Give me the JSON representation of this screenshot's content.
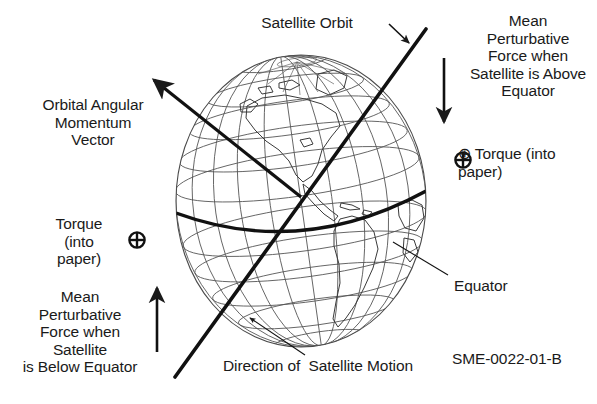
{
  "figure": {
    "code": "SME-0022-01-B",
    "background_color": "#ffffff",
    "ink_color": "#1a1a1a",
    "graticule_color": "#555555"
  },
  "labels": {
    "orbital_angular_momentum": "Orbital Angular\nMomentum\nVector",
    "satellite_orbit": "Satellite Orbit",
    "mean_force_above": "Mean\nPerturbative\nForce when\nSatellite is Above\nEquator",
    "torque_right": "⊕ Torque (into\npaper)",
    "torque_left": "Torque\n(into\npaper)",
    "mean_force_below": "Mean\nPerturbative\nForce when\nSatellite\nis Below Equator",
    "equator": "Equator",
    "direction_motion": "Direction of  Satellite Motion"
  },
  "symbols": {
    "torque_glyph": "circle-plus-cross",
    "torque_right_icon": "torque-into-paper-icon",
    "torque_left_icon": "torque-into-paper-icon"
  },
  "globe": {
    "center_x": 301,
    "center_y": 201,
    "radius_x": 125,
    "radius_y": 146,
    "meridian_count": 12,
    "parallel_count": 11,
    "tilt_degrees": 8,
    "equator_emphasized": true,
    "continents": "North and South America"
  },
  "vectors": {
    "angular_momentum": {
      "name": "orbital-angular-momentum-vector",
      "from_x": 301,
      "from_y": 197,
      "to_x": 148,
      "to_y": 75,
      "arrowhead": "tip"
    },
    "orbit_line": {
      "name": "satellite-orbit-line",
      "from_x": 175,
      "from_y": 377,
      "to_x": 426,
      "to_y": 29,
      "arrowhead": "none"
    },
    "force_above_arrow": {
      "name": "mean-perturbative-force-above-arrow",
      "x": 444,
      "from_y": 58,
      "to_y": 128,
      "direction": "down"
    },
    "force_below_arrow": {
      "name": "mean-perturbative-force-below-arrow",
      "x": 157,
      "from_y": 352,
      "to_y": 282,
      "direction": "up"
    }
  },
  "leaders": {
    "satellite_orbit": {
      "from_x": 389,
      "from_y": 24,
      "to_x": 412,
      "to_y": 46
    },
    "equator": {
      "from_x": 448,
      "from_y": 275,
      "to_x": 393,
      "to_y": 242
    },
    "direction_motion": {
      "from_x": 305,
      "from_y": 355,
      "to_x": 247,
      "to_y": 315
    }
  }
}
